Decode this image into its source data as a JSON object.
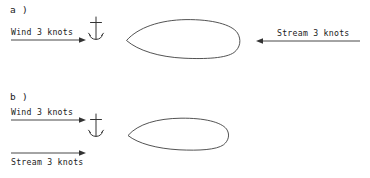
{
  "figure": {
    "background": "#ffffff",
    "stroke_color": "#333333",
    "panels": [
      {
        "id": "a",
        "label": "a )",
        "wind": {
          "label": "Wind  3 knots",
          "direction": "right",
          "arrow": {
            "x1": 11,
            "y1": 40,
            "x2": 85,
            "y2": 40
          },
          "label_position": "above"
        },
        "stream": {
          "label": "Stream 3 knots",
          "direction": "left",
          "arrow": {
            "x1": 360,
            "y1": 41,
            "x2": 256,
            "y2": 41
          },
          "label_position": "above"
        },
        "anchor": {
          "x": 96,
          "y": 17,
          "height": 23
        },
        "hull": {
          "bow": "left",
          "x": 126,
          "y": 19,
          "width": 113,
          "height": 40
        }
      },
      {
        "id": "b",
        "label": "b )",
        "wind": {
          "label": "Wind  3 knots",
          "direction": "right",
          "arrow": {
            "x1": 11,
            "y1": 31,
            "x2": 86,
            "y2": 31
          },
          "label_position": "above"
        },
        "stream": {
          "label": "Stream 3 knots",
          "direction": "right",
          "arrow": {
            "x1": 11,
            "y1": 64,
            "x2": 86,
            "y2": 64
          },
          "label_position": "below"
        },
        "anchor": {
          "x": 96,
          "y": 25,
          "height": 23
        },
        "hull": {
          "bow": "left",
          "x": 128,
          "y": 29,
          "width": 101,
          "height": 35
        }
      }
    ]
  }
}
